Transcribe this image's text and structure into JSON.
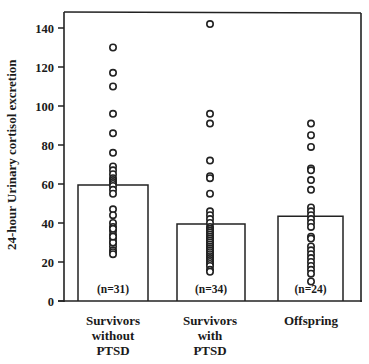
{
  "chart_data": {
    "type": "bar",
    "title": "",
    "xlabel": "",
    "ylabel": "24-hour Urinary cortisol excretion",
    "ylim": [
      0,
      148
    ],
    "yticks": [
      0,
      20,
      40,
      60,
      80,
      100,
      120,
      140
    ],
    "grid": false,
    "legend": null,
    "categories": [
      "Survivors without PTSD",
      "Survivors with PTSD",
      "Offspring"
    ],
    "category_lines": [
      [
        "Survivors",
        "without",
        "PTSD"
      ],
      [
        "Survivors",
        "with",
        "PTSD"
      ],
      [
        "Offspring"
      ]
    ],
    "values": [
      59.5,
      39.5,
      43.5
    ],
    "n_labels": [
      "(n=31)",
      "(n=34)",
      "(n=24)"
    ],
    "points": [
      [
        130,
        117,
        110,
        96,
        86,
        76,
        69,
        67,
        65,
        63,
        62,
        61,
        60,
        59,
        57,
        55,
        47,
        44,
        40,
        38,
        36,
        34,
        32,
        30,
        28,
        26,
        25,
        24,
        30,
        33,
        37
      ],
      [
        142,
        96,
        91,
        72,
        64,
        63,
        55,
        46,
        44,
        42,
        40,
        38,
        37,
        36,
        35,
        34,
        33,
        32,
        31,
        30,
        29,
        28,
        27,
        26,
        25,
        24,
        23,
        22,
        21,
        20,
        19,
        18,
        16,
        15
      ],
      [
        91,
        85,
        79,
        68,
        67,
        62,
        57,
        48,
        46,
        44,
        42,
        40,
        38,
        33,
        32,
        28,
        26,
        24,
        22,
        20,
        18,
        16,
        14,
        10
      ]
    ]
  }
}
